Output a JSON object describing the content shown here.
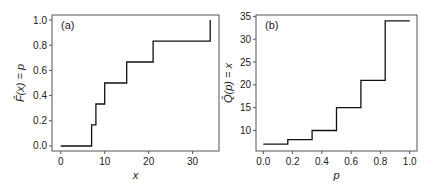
{
  "chart_data": [
    {
      "type": "line",
      "step": true,
      "panel_label": "(a)",
      "title": "",
      "xlabel": "x",
      "ylabel": "F̂(x) = p",
      "xlim": [
        -2,
        36
      ],
      "ylim": [
        -0.04,
        1.04
      ],
      "xticks": [
        0,
        10,
        20,
        30
      ],
      "xtick_labels": [
        "0",
        "10",
        "20",
        "30"
      ],
      "yticks": [
        0.0,
        0.2,
        0.4,
        0.6,
        0.8,
        1.0
      ],
      "ytick_labels": [
        "0.0",
        "0.2",
        "0.4",
        "0.6",
        "0.8",
        "1.0"
      ],
      "grid": false,
      "series": [
        {
          "name": "empirical CDF",
          "x": [
            0,
            7,
            7,
            8,
            8,
            10,
            10,
            15,
            15,
            21,
            21,
            34,
            34
          ],
          "y": [
            0,
            0,
            0.167,
            0.167,
            0.333,
            0.333,
            0.5,
            0.5,
            0.667,
            0.667,
            0.833,
            0.833,
            1.0
          ]
        }
      ]
    },
    {
      "type": "line",
      "step": true,
      "panel_label": "(b)",
      "title": "",
      "xlabel": "p",
      "ylabel": "Q̂(p) = x",
      "xlim": [
        -0.05,
        1.05
      ],
      "ylim": [
        5.5,
        35.3
      ],
      "xticks": [
        0.0,
        0.2,
        0.4,
        0.6,
        0.8,
        1.0
      ],
      "xtick_labels": [
        "0.0",
        "0.2",
        "0.4",
        "0.6",
        "0.8",
        "1.0"
      ],
      "yticks": [
        10,
        15,
        20,
        25,
        30,
        35
      ],
      "ytick_labels": [
        "10",
        "15",
        "20",
        "25",
        "30",
        "35"
      ],
      "grid": false,
      "series": [
        {
          "name": "empirical quantile function",
          "x": [
            0.0,
            0.167,
            0.167,
            0.333,
            0.333,
            0.5,
            0.5,
            0.667,
            0.667,
            0.833,
            0.833,
            1.0
          ],
          "y": [
            7,
            7,
            8,
            8,
            10,
            10,
            15,
            15,
            21,
            21,
            34,
            34
          ]
        }
      ]
    }
  ]
}
